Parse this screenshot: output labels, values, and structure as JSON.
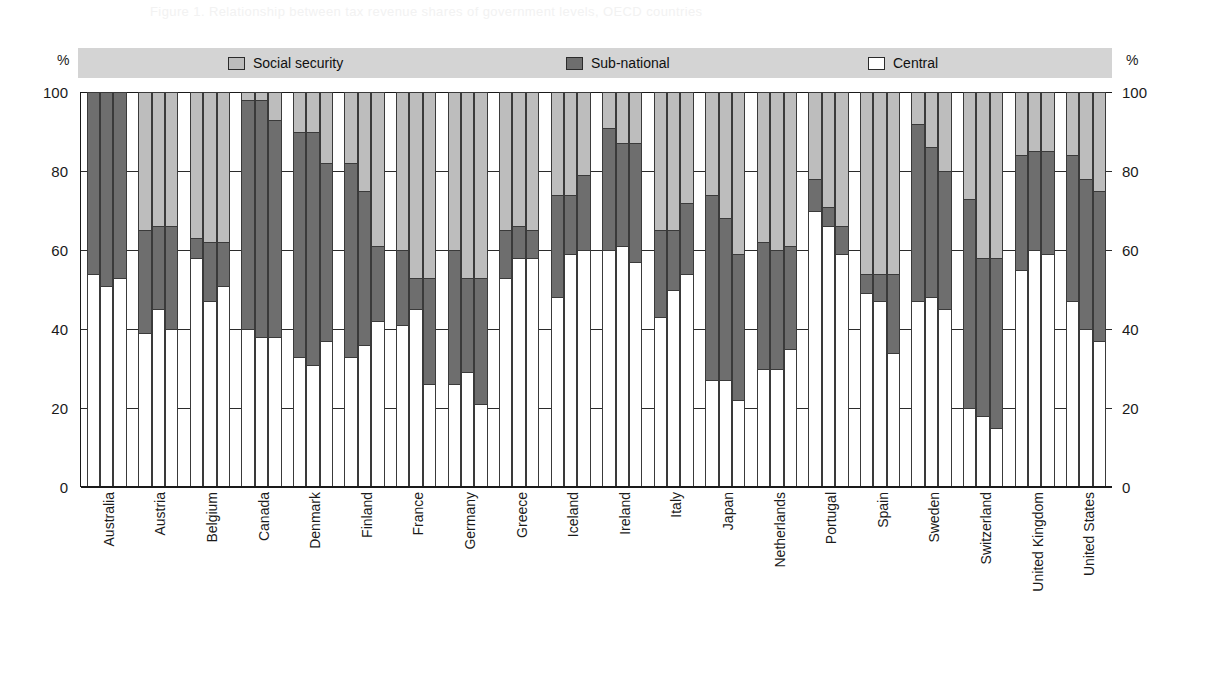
{
  "ghost_text": "Figure 1. Relationship between tax revenue shares of government levels, OECD countries",
  "axis": {
    "unit_label": "%",
    "ticks": [
      0,
      20,
      40,
      60,
      80,
      100
    ],
    "ylim": [
      0,
      100
    ]
  },
  "legend": {
    "items": [
      {
        "label": "Social security",
        "color": "#bdbdbd",
        "key": "social"
      },
      {
        "label": "Sub-national",
        "color": "#6e6e6e",
        "key": "sub"
      },
      {
        "label": "Central",
        "color": "#ffffff",
        "key": "central"
      }
    ]
  },
  "chart_data": {
    "type": "bar",
    "title": "",
    "subtitle": "",
    "xlabel": "",
    "ylabel": "%",
    "ylim": [
      0,
      100
    ],
    "grid": true,
    "stacked": true,
    "stack_order": [
      "central",
      "sub",
      "social"
    ],
    "bars_per_category": 3,
    "legend_position": "top",
    "categories": [
      "Australia",
      "Austria",
      "Belgium",
      "Canada",
      "Denmark",
      "Finland",
      "France",
      "Germany",
      "Greece",
      "Iceland",
      "Ireland",
      "Italy",
      "Japan",
      "Netherlands",
      "Portugal",
      "Spain",
      "Sweden",
      "Switzerland",
      "United Kingdom",
      "United States"
    ],
    "series": [
      {
        "name": "Central",
        "key": "central",
        "color": "#ffffff"
      },
      {
        "name": "Sub-national",
        "key": "sub",
        "color": "#6e6e6e"
      },
      {
        "name": "Social security",
        "key": "social",
        "color": "#bdbdbd"
      }
    ],
    "values": {
      "Australia": [
        {
          "central": 54,
          "sub": 46,
          "social": 0
        },
        {
          "central": 51,
          "sub": 49,
          "social": 0
        },
        {
          "central": 53,
          "sub": 47,
          "social": 0
        }
      ],
      "Austria": [
        {
          "central": 39,
          "sub": 26,
          "social": 35
        },
        {
          "central": 45,
          "sub": 21,
          "social": 34
        },
        {
          "central": 40,
          "sub": 26,
          "social": 34
        }
      ],
      "Belgium": [
        {
          "central": 58,
          "sub": 5,
          "social": 37
        },
        {
          "central": 47,
          "sub": 15,
          "social": 38
        },
        {
          "central": 51,
          "sub": 11,
          "social": 38
        }
      ],
      "Canada": [
        {
          "central": 40,
          "sub": 58,
          "social": 2
        },
        {
          "central": 38,
          "sub": 60,
          "social": 2
        },
        {
          "central": 38,
          "sub": 55,
          "social": 7
        }
      ],
      "Denmark": [
        {
          "central": 33,
          "sub": 57,
          "social": 10
        },
        {
          "central": 31,
          "sub": 59,
          "social": 10
        },
        {
          "central": 37,
          "sub": 45,
          "social": 18
        }
      ],
      "Finland": [
        {
          "central": 33,
          "sub": 49,
          "social": 18
        },
        {
          "central": 36,
          "sub": 39,
          "social": 25
        },
        {
          "central": 42,
          "sub": 19,
          "social": 39
        }
      ],
      "France": [
        {
          "central": 41,
          "sub": 19,
          "social": 40
        },
        {
          "central": 45,
          "sub": 8,
          "social": 47
        },
        {
          "central": 26,
          "sub": 27,
          "social": 47
        }
      ],
      "Germany": [
        {
          "central": 26,
          "sub": 34,
          "social": 40
        },
        {
          "central": 29,
          "sub": 24,
          "social": 47
        },
        {
          "central": 21,
          "sub": 32,
          "social": 47
        }
      ],
      "Greece": [
        {
          "central": 53,
          "sub": 12,
          "social": 35
        },
        {
          "central": 58,
          "sub": 8,
          "social": 34
        },
        {
          "central": 58,
          "sub": 7,
          "social": 35
        }
      ],
      "Iceland": [
        {
          "central": 48,
          "sub": 26,
          "social": 26
        },
        {
          "central": 59,
          "sub": 15,
          "social": 26
        },
        {
          "central": 60,
          "sub": 19,
          "social": 21
        }
      ],
      "Ireland": [
        {
          "central": 60,
          "sub": 31,
          "social": 9
        },
        {
          "central": 61,
          "sub": 26,
          "social": 13
        },
        {
          "central": 57,
          "sub": 30,
          "social": 13
        }
      ],
      "Italy": [
        {
          "central": 43,
          "sub": 22,
          "social": 35
        },
        {
          "central": 50,
          "sub": 15,
          "social": 35
        },
        {
          "central": 54,
          "sub": 18,
          "social": 28
        }
      ],
      "Japan": [
        {
          "central": 27,
          "sub": 47,
          "social": 26
        },
        {
          "central": 27,
          "sub": 41,
          "social": 32
        },
        {
          "central": 22,
          "sub": 37,
          "social": 41
        }
      ],
      "Netherlands": [
        {
          "central": 30,
          "sub": 32,
          "social": 38
        },
        {
          "central": 30,
          "sub": 30,
          "social": 40
        },
        {
          "central": 35,
          "sub": 26,
          "social": 39
        }
      ],
      "Portugal": [
        {
          "central": 70,
          "sub": 8,
          "social": 22
        },
        {
          "central": 66,
          "sub": 5,
          "social": 29
        },
        {
          "central": 59,
          "sub": 7,
          "social": 34
        }
      ],
      "Spain": [
        {
          "central": 49,
          "sub": 5,
          "social": 46
        },
        {
          "central": 47,
          "sub": 7,
          "social": 46
        },
        {
          "central": 34,
          "sub": 20,
          "social": 46
        }
      ],
      "Sweden": [
        {
          "central": 47,
          "sub": 45,
          "social": 8
        },
        {
          "central": 48,
          "sub": 38,
          "social": 14
        },
        {
          "central": 45,
          "sub": 35,
          "social": 20
        }
      ],
      "Switzerland": [
        {
          "central": 20,
          "sub": 53,
          "social": 27
        },
        {
          "central": 18,
          "sub": 40,
          "social": 42
        },
        {
          "central": 15,
          "sub": 43,
          "social": 42
        }
      ],
      "United Kingdom": [
        {
          "central": 55,
          "sub": 29,
          "social": 16
        },
        {
          "central": 60,
          "sub": 25,
          "social": 15
        },
        {
          "central": 59,
          "sub": 26,
          "social": 15
        }
      ],
      "United States": [
        {
          "central": 47,
          "sub": 37,
          "social": 16
        },
        {
          "central": 40,
          "sub": 38,
          "social": 22
        },
        {
          "central": 37,
          "sub": 38,
          "social": 25
        }
      ]
    }
  }
}
